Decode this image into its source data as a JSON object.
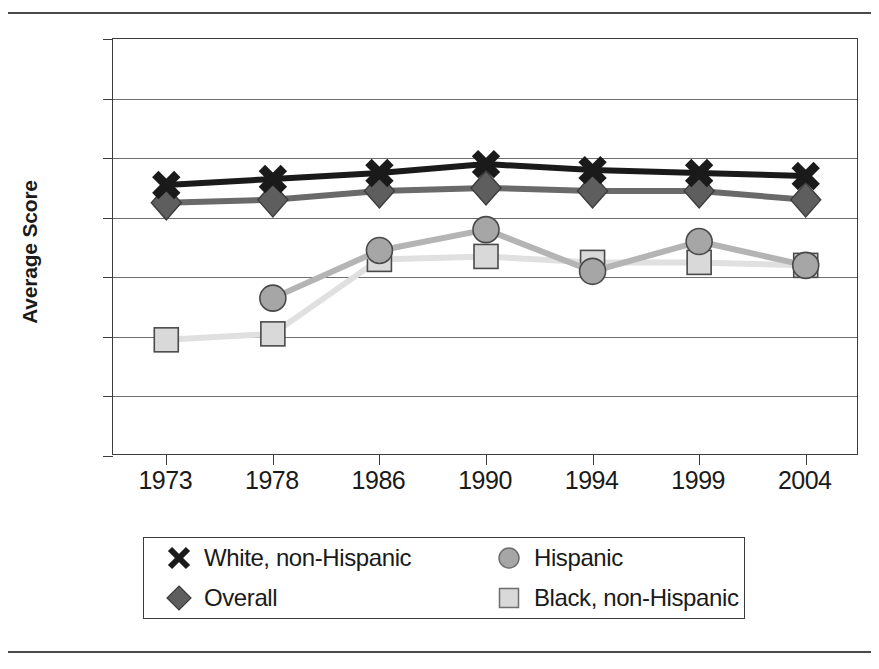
{
  "chart_data": {
    "type": "line",
    "title": "",
    "xlabel": "",
    "ylabel": "Average Score",
    "categories": [
      "1973",
      "1978",
      "1986",
      "1990",
      "1994",
      "1999",
      "2004"
    ],
    "ylim": [
      200,
      340
    ],
    "yticks": [
      "200",
      "220",
      "240",
      "260",
      "280",
      "300",
      "320",
      "340"
    ],
    "ytick_step": 20,
    "grid": true,
    "legend_position": "below-plot",
    "series": [
      {
        "name": "White, non-Hispanic",
        "marker": "x-cross",
        "color": "#1a1a1a",
        "line_color": "#1a1a1a",
        "values": [
          291,
          293,
          295,
          298,
          296,
          295,
          294
        ]
      },
      {
        "name": "Overall",
        "marker": "diamond",
        "color": "#5e5e5e",
        "line_color": "#6a6a6a",
        "values": [
          285,
          286,
          289,
          290,
          289,
          289,
          286
        ]
      },
      {
        "name": "Hispanic",
        "marker": "circle",
        "color": "#a6a6a6",
        "line_color": "#b4b4b4",
        "values": [
          null,
          253,
          269,
          276,
          262,
          272,
          264
        ]
      },
      {
        "name": "Black, non-Hispanic",
        "marker": "square",
        "color": "#d9d9d9",
        "line_color": "#e0e0e0",
        "values": [
          239,
          241,
          266,
          267,
          265,
          265,
          264
        ]
      }
    ]
  },
  "legend": {
    "items": [
      {
        "label": "White, non-Hispanic",
        "marker": "x-cross",
        "color": "#1a1a1a"
      },
      {
        "label": "Hispanic",
        "marker": "circle",
        "color": "#a6a6a6"
      },
      {
        "label": "Overall",
        "marker": "diamond",
        "color": "#5e5e5e"
      },
      {
        "label": "Black, non-Hispanic",
        "marker": "square",
        "color": "#d9d9d9"
      }
    ]
  },
  "colors": {
    "axis": "#3c3c3c",
    "gridline": "#6e6e6e",
    "rule": "#4a4a4a",
    "text": "#1a1a1a",
    "background": "#ffffff"
  }
}
